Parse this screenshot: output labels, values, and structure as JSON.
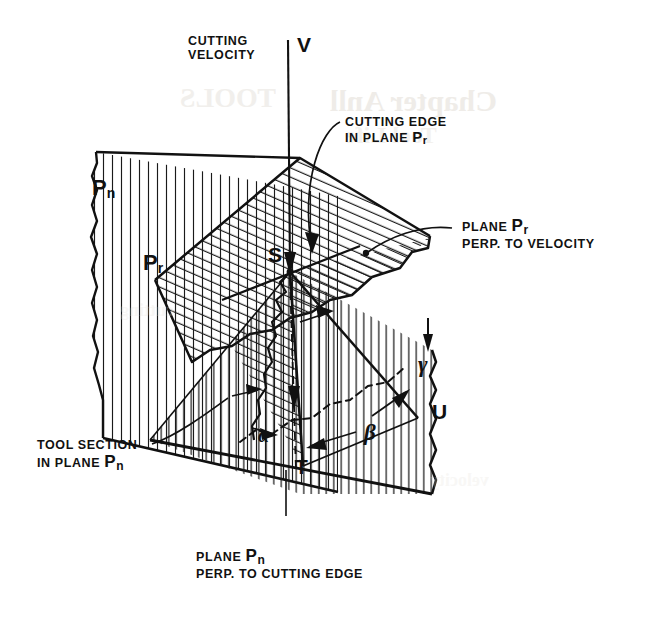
{
  "figure": {
    "type": "technical-line-diagram",
    "background_color": "#ffffff",
    "ink_color": "#111111"
  },
  "labels": {
    "cutting_velocity": {
      "line1": "CUTTING",
      "line2": "VELOCITY",
      "x": 188,
      "y": 34
    },
    "velocity_symbol": {
      "text": "V",
      "x": 297,
      "y": 37
    },
    "cutting_edge": {
      "line1": "CUTTING EDGE",
      "line2_prefix": "IN PLANE ",
      "line2_sub_base": "P",
      "line2_sub": "r",
      "x": 345,
      "y": 115
    },
    "plane_pr_callout": {
      "line1_prefix": "PLANE ",
      "line1_sub_base": "P",
      "line1_sub": "r",
      "line2": "PERP. TO VELOCITY",
      "x": 462,
      "y": 218
    },
    "tool_section": {
      "line1": "TOOL SECTION",
      "line2_prefix": "IN PLANE ",
      "line2_sub_base": "P",
      "line2_sub": "n",
      "x": 37,
      "y": 438
    },
    "plane_pn_caption": {
      "line1_prefix": "PLANE ",
      "line1_sub_base": "P",
      "line1_sub": "n",
      "line2": "PERP. TO CUTTING EDGE",
      "x": 196,
      "y": 548
    },
    "pn_plane_tag": {
      "base": "P",
      "sub": "n",
      "x": 92,
      "y": 178
    },
    "pr_plane_tag": {
      "base": "P",
      "sub": "r",
      "x": 143,
      "y": 253
    },
    "point_s": {
      "text": "S",
      "x": 268,
      "y": 243
    },
    "point_t": {
      "text": "T",
      "x": 295,
      "y": 455
    },
    "point_u": {
      "text": "U",
      "x": 432,
      "y": 402
    },
    "angle_alpha": {
      "text": "α",
      "x": 258,
      "y": 430
    },
    "angle_beta": {
      "text": "β",
      "x": 364,
      "y": 428
    },
    "angle_gamma": {
      "text": "γ",
      "x": 418,
      "y": 358
    }
  },
  "bleed_through": [
    {
      "text": "Chapter Anll",
      "x": 330,
      "y": 84,
      "size": 30,
      "opacity": 0.55
    },
    {
      "text": "TOOLS",
      "x": 180,
      "y": 82,
      "size": 28,
      "opacity": 0.45
    },
    {
      "text": "Tool Life",
      "x": 345,
      "y": 122,
      "size": 24,
      "opacity": 0.4
    },
    {
      "text": "cutting",
      "x": 120,
      "y": 300,
      "size": 18,
      "opacity": 0.25
    },
    {
      "text": "velocity",
      "x": 430,
      "y": 470,
      "size": 18,
      "opacity": 0.22
    }
  ],
  "geometry": {
    "vertex_S": [
      290,
      272
    ],
    "point_T": [
      303,
      466
    ],
    "point_U": [
      418,
      418
    ],
    "velocity_line_top": [
      288,
      40
    ],
    "pn_plane_note": "vertical-hatched plane, left, torn left edge",
    "pr_plane_note": "diagonal-hatched parallelogram, center, torn right edge",
    "tool_body_note": "vertical-hatched wedge, lower right, torn right edge"
  }
}
